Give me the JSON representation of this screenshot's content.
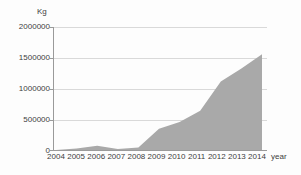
{
  "chart_data": {
    "type": "area",
    "title": "",
    "ylabel": "Kg",
    "xlabel": "year",
    "categories": [
      "2004",
      "2005",
      "2006",
      "2007",
      "2008",
      "2009",
      "2010",
      "2011",
      "2012",
      "2013",
      "2014"
    ],
    "values": [
      15000,
      40000,
      85000,
      30000,
      55000,
      360000,
      470000,
      650000,
      1120000,
      1330000,
      1560000
    ],
    "ylim": [
      0,
      2000000
    ],
    "y_ticks": [
      0,
      500000,
      1000000,
      1500000,
      2000000
    ],
    "grid": true,
    "legend": false,
    "colors": {
      "area_fill": "#a9a9a9",
      "gridline": "#d9d9d9",
      "axis_line": "#9a9a9a",
      "label_text": "#3d3d3d",
      "background": "#fdfdfd"
    }
  }
}
